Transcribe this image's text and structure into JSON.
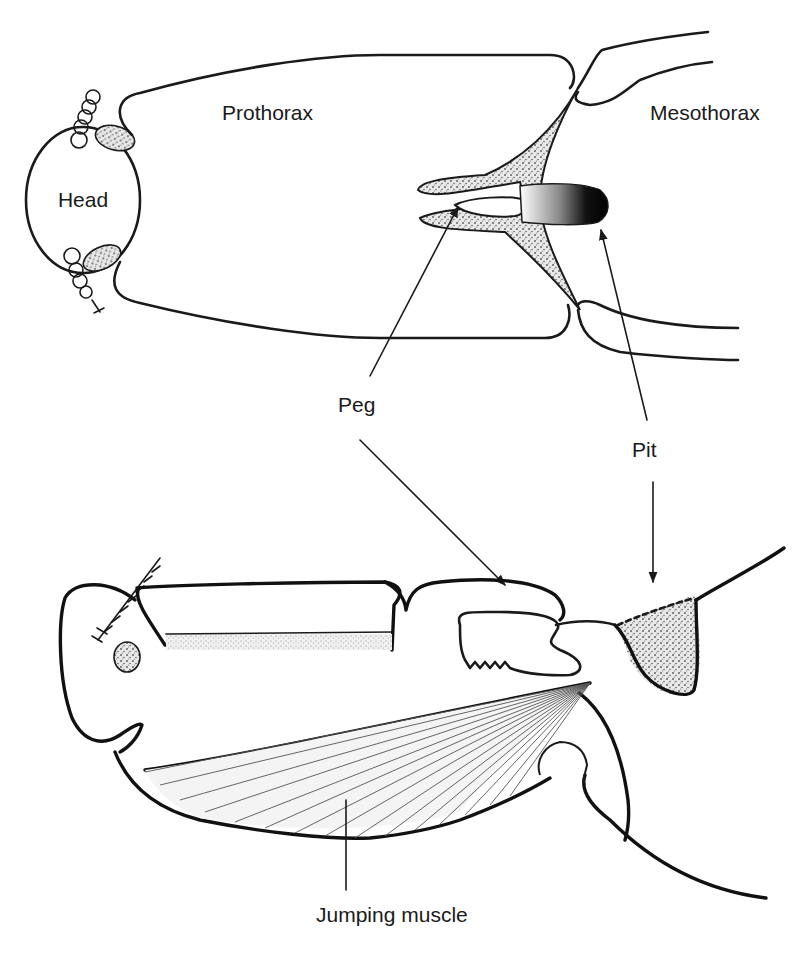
{
  "figure": {
    "type": "anatomical-diagram",
    "top_view": {
      "labels": {
        "head": "Head",
        "prothorax": "Prothorax",
        "mesothorax": "Mesothorax"
      }
    },
    "callouts": {
      "peg": "Peg",
      "pit": "Pit"
    },
    "side_view": {
      "labels": {
        "jumping_muscle": "Jumping muscle"
      }
    },
    "colors": {
      "ink": "#1a1a1a",
      "stipple": "#8a8a8a",
      "pit_dark": "#0a0a0a",
      "background": "#ffffff"
    }
  }
}
